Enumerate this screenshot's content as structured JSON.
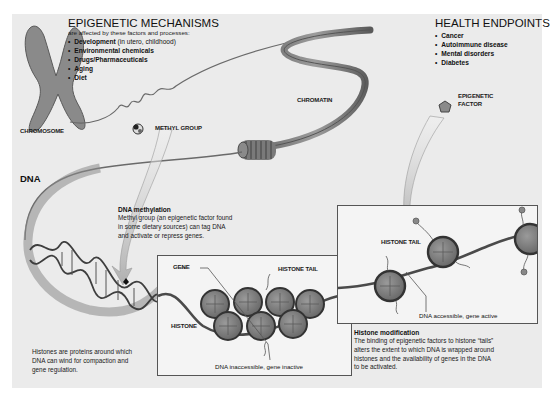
{
  "mechanisms": {
    "title": "EPIGENETIC MECHANISMS",
    "subtitle": "are affected by these factors and processes:",
    "items": [
      {
        "bold": "Development",
        "note": " (in utero, childhood)"
      },
      {
        "bold": "Environmental chemicals",
        "note": ""
      },
      {
        "bold": "Drugs/Pharmaceuticals",
        "note": ""
      },
      {
        "bold": "Aging",
        "note": ""
      },
      {
        "bold": "Diet",
        "note": ""
      }
    ]
  },
  "health": {
    "title": "HEALTH ENDPOINTS",
    "items": [
      "Cancer",
      "Autoimmune disease",
      "Mental disorders",
      "Diabetes"
    ]
  },
  "labels": {
    "chromosome": "CHROMOSOME",
    "chromatin": "CHROMATIN",
    "methyl_group": "METHYL GROUP",
    "epigenetic_factor_1": "EPIGENETIC",
    "epigenetic_factor_2": "FACTOR",
    "dna": "DNA",
    "gene": "GENE",
    "histone": "HISTONE",
    "histone_tail_left": "HISTONE TAIL",
    "histone_tail_right": "HISTONE TAIL",
    "dna_inaccessible": "DNA inaccessible, gene inactive",
    "dna_accessible": "DNA accessible, gene active"
  },
  "methylation": {
    "title": "DNA methylation",
    "lines": [
      "Methyl group (an epigenetic factor found",
      "in some dietary sources) can tag DNA",
      "and activate or repress genes."
    ]
  },
  "histones_note": {
    "lines": [
      "Histones are proteins around which",
      "DNA can wind for compaction and",
      "gene regulation."
    ]
  },
  "histone_modification": {
    "title": "Histone modification",
    "lines": [
      "The binding of epigenetic factors to histone “tails”",
      "alters the extent to which DNA is wrapped around",
      "histones and the availability of genes in the DNA",
      "to be activated."
    ]
  },
  "colors": {
    "panel_bg": "#ebebeb",
    "strand": "#4a4a4a",
    "histone": "#7d7d7d",
    "arrow": "#c8c8c8"
  }
}
